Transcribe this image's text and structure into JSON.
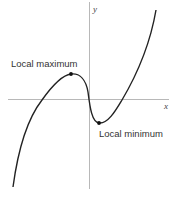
{
  "diagram": {
    "type": "function-graph",
    "axes": {
      "x_label": "x",
      "y_label": "y"
    },
    "annotations": {
      "local_max_label": "Local maximum",
      "local_min_label": "Local minimum"
    },
    "colors": {
      "curve": "#222222",
      "axes": "#b8b8b8",
      "text": "#333333"
    }
  }
}
